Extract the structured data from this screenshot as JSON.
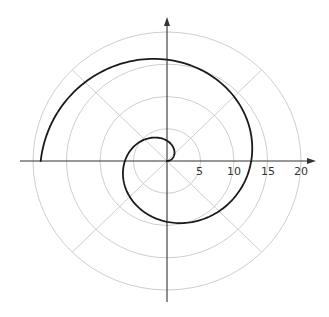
{
  "chart_data": {
    "type": "line",
    "subtype": "polar",
    "title": "",
    "equation": "r = 2θ",
    "theta_range": [
      0,
      9.4248
    ],
    "series": [
      {
        "name": "spiral",
        "color": "#1a1a1a",
        "theta": [
          0,
          1.5708,
          3.1416,
          4.7124,
          6.2832,
          7.854,
          9.4248
        ],
        "r": [
          0,
          3.14,
          6.28,
          9.42,
          12.57,
          15.71,
          18.85
        ]
      }
    ],
    "radial_ticks": [
      "5",
      "10",
      "15",
      "20"
    ],
    "radial_values": [
      5,
      10,
      15,
      20
    ],
    "angular_grid_degrees": [
      0,
      45,
      90,
      135,
      180,
      225,
      270,
      315
    ],
    "rlim": [
      0,
      20
    ],
    "grid": true,
    "xlabel": "",
    "ylabel": "",
    "legend": null
  },
  "style": {
    "grid_color": "#c8c8c8",
    "axis_color": "#333333",
    "curve_color": "#1a1a1a"
  }
}
